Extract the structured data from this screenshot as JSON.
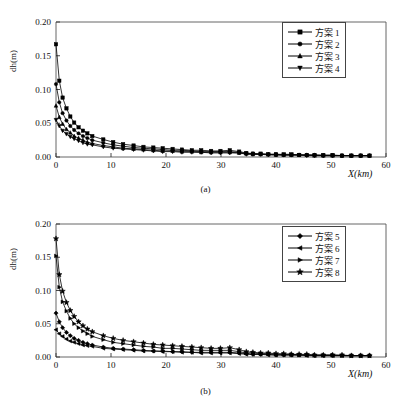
{
  "figure": {
    "panels": [
      {
        "id": "a",
        "caption": "(a)",
        "xlabel": "X(km)",
        "ylabel": "dh(m)",
        "legend": [
          {
            "label": "方案",
            "num": "1",
            "marker": "square"
          },
          {
            "label": "方案",
            "num": "2",
            "marker": "circle"
          },
          {
            "label": "方案",
            "num": "3",
            "marker": "triangle-up"
          },
          {
            "label": "方案",
            "num": "4",
            "marker": "triangle-down"
          }
        ]
      },
      {
        "id": "b",
        "caption": "(b)",
        "xlabel": "X(km)",
        "ylabel": "dh(m)",
        "legend": [
          {
            "label": "方案",
            "num": "5",
            "marker": "diamond"
          },
          {
            "label": "方案",
            "num": "6",
            "marker": "triangle-left"
          },
          {
            "label": "方案",
            "num": "7",
            "marker": "triangle-right"
          },
          {
            "label": "方案",
            "num": "8",
            "marker": "star"
          }
        ]
      }
    ]
  },
  "chart_data": [
    {
      "type": "line",
      "panel": "(a)",
      "title": "",
      "xlabel": "X(km)",
      "ylabel": "dh(m)",
      "xlim": [
        0,
        60
      ],
      "ylim": [
        0,
        0.2
      ],
      "xticks": [
        0,
        10,
        20,
        30,
        40,
        50,
        60
      ],
      "yticks": [
        0.0,
        0.05,
        0.1,
        0.15,
        0.2
      ],
      "ytick_labels": [
        "0.00",
        "0.05",
        "0.10",
        "0.15",
        "0.20"
      ],
      "xtick_labels": [
        "0",
        "10",
        "20",
        "30",
        "40",
        "50",
        "60"
      ],
      "grid": false,
      "legend_position": "upper-right",
      "color": "#000000",
      "x": [
        0,
        0.6,
        1.2,
        1.9,
        2.6,
        3.3,
        4.1,
        4.9,
        5.7,
        6.6,
        8.6,
        10.4,
        12.2,
        14.1,
        15.9,
        17.7,
        19.4,
        21.2,
        22.9,
        24.7,
        26.4,
        28.2,
        29.9,
        31.6,
        33.3,
        34.6,
        35.8,
        37.2,
        38.6,
        40.0,
        41.4,
        42.8,
        44.2,
        45.6,
        47.0,
        48.6,
        50.3,
        52.0,
        53.7,
        55.4,
        57.0
      ],
      "series": [
        {
          "name": "方案 1",
          "marker": "square",
          "values": [
            0.167,
            0.113,
            0.088,
            0.072,
            0.06,
            0.051,
            0.044,
            0.039,
            0.035,
            0.031,
            0.026,
            0.022,
            0.019,
            0.017,
            0.015,
            0.014,
            0.013,
            0.012,
            0.011,
            0.01,
            0.01,
            0.009,
            0.009,
            0.01,
            0.008,
            0.006,
            0.005,
            0.005,
            0.004,
            0.004,
            0.004,
            0.004,
            0.003,
            0.003,
            0.003,
            0.003,
            0.003,
            0.002,
            0.002,
            0.002,
            0.002
          ]
        },
        {
          "name": "方案 2",
          "marker": "circle",
          "values": [
            0.108,
            0.081,
            0.065,
            0.054,
            0.046,
            0.04,
            0.035,
            0.031,
            0.028,
            0.025,
            0.021,
            0.018,
            0.016,
            0.014,
            0.013,
            0.012,
            0.011,
            0.01,
            0.01,
            0.009,
            0.008,
            0.008,
            0.008,
            0.008,
            0.007,
            0.005,
            0.005,
            0.004,
            0.004,
            0.004,
            0.003,
            0.003,
            0.003,
            0.003,
            0.003,
            0.002,
            0.002,
            0.002,
            0.002,
            0.002,
            0.002
          ]
        },
        {
          "name": "方案 3",
          "marker": "triangle-up",
          "values": [
            0.076,
            0.059,
            0.049,
            0.041,
            0.036,
            0.031,
            0.028,
            0.025,
            0.022,
            0.02,
            0.017,
            0.015,
            0.013,
            0.012,
            0.011,
            0.01,
            0.009,
            0.009,
            0.008,
            0.008,
            0.007,
            0.007,
            0.007,
            0.007,
            0.006,
            0.005,
            0.004,
            0.004,
            0.004,
            0.003,
            0.003,
            0.003,
            0.003,
            0.003,
            0.002,
            0.002,
            0.002,
            0.002,
            0.002,
            0.002,
            0.002
          ]
        },
        {
          "name": "方案 4",
          "marker": "triangle-down",
          "values": [
            0.055,
            0.046,
            0.039,
            0.034,
            0.03,
            0.027,
            0.024,
            0.021,
            0.019,
            0.018,
            0.015,
            0.013,
            0.012,
            0.011,
            0.01,
            0.009,
            0.008,
            0.008,
            0.007,
            0.007,
            0.007,
            0.006,
            0.006,
            0.006,
            0.006,
            0.004,
            0.004,
            0.004,
            0.003,
            0.003,
            0.003,
            0.003,
            0.003,
            0.002,
            0.002,
            0.002,
            0.002,
            0.002,
            0.002,
            0.002,
            0.002
          ]
        }
      ]
    },
    {
      "type": "line",
      "panel": "(b)",
      "title": "",
      "xlabel": "X(km)",
      "ylabel": "dh(m)",
      "xlim": [
        0,
        60
      ],
      "ylim": [
        0,
        0.2
      ],
      "xticks": [
        0,
        10,
        20,
        30,
        40,
        50,
        60
      ],
      "yticks": [
        0.0,
        0.05,
        0.1,
        0.15,
        0.2
      ],
      "ytick_labels": [
        "0.00",
        "0.05",
        "0.10",
        "0.15",
        "0.20"
      ],
      "xtick_labels": [
        "0",
        "10",
        "20",
        "30",
        "40",
        "50",
        "60"
      ],
      "grid": false,
      "legend_position": "upper-right",
      "color": "#000000",
      "x": [
        0,
        0.6,
        1.2,
        1.9,
        2.6,
        3.3,
        4.1,
        4.9,
        5.7,
        6.6,
        8.6,
        10.4,
        12.2,
        14.1,
        15.9,
        17.7,
        19.4,
        21.2,
        22.9,
        24.7,
        26.4,
        28.2,
        29.9,
        31.6,
        33.3,
        34.6,
        35.8,
        37.2,
        38.6,
        40.0,
        41.4,
        42.8,
        44.2,
        45.6,
        47.0,
        48.6,
        50.3,
        52.0,
        53.7,
        55.4,
        57.0
      ],
      "series": [
        {
          "name": "方案 5",
          "marker": "diamond",
          "values": [
            0.066,
            0.053,
            0.044,
            0.037,
            0.032,
            0.028,
            0.025,
            0.022,
            0.02,
            0.018,
            0.015,
            0.013,
            0.012,
            0.011,
            0.01,
            0.009,
            0.009,
            0.008,
            0.008,
            0.007,
            0.007,
            0.007,
            0.007,
            0.007,
            0.006,
            0.005,
            0.004,
            0.004,
            0.004,
            0.003,
            0.003,
            0.003,
            0.003,
            0.003,
            0.002,
            0.002,
            0.002,
            0.002,
            0.002,
            0.002,
            0.002
          ]
        },
        {
          "name": "方案 6",
          "marker": "triangle-left",
          "values": [
            0.041,
            0.035,
            0.031,
            0.027,
            0.024,
            0.022,
            0.02,
            0.018,
            0.017,
            0.016,
            0.013,
            0.012,
            0.011,
            0.01,
            0.009,
            0.009,
            0.008,
            0.008,
            0.007,
            0.007,
            0.006,
            0.006,
            0.006,
            0.006,
            0.005,
            0.004,
            0.004,
            0.004,
            0.003,
            0.003,
            0.003,
            0.003,
            0.003,
            0.002,
            0.002,
            0.002,
            0.002,
            0.002,
            0.002,
            0.002,
            0.002
          ]
        },
        {
          "name": "方案 7",
          "marker": "triangle-right",
          "values": [
            0.152,
            0.105,
            0.083,
            0.069,
            0.058,
            0.05,
            0.044,
            0.039,
            0.035,
            0.031,
            0.026,
            0.022,
            0.02,
            0.018,
            0.016,
            0.015,
            0.013,
            0.013,
            0.012,
            0.011,
            0.01,
            0.01,
            0.01,
            0.01,
            0.008,
            0.006,
            0.006,
            0.005,
            0.005,
            0.004,
            0.004,
            0.004,
            0.003,
            0.003,
            0.003,
            0.003,
            0.003,
            0.002,
            0.002,
            0.002,
            0.002
          ]
        },
        {
          "name": "方案 8",
          "marker": "star",
          "values": [
            0.178,
            0.124,
            0.099,
            0.082,
            0.07,
            0.061,
            0.053,
            0.047,
            0.042,
            0.038,
            0.032,
            0.028,
            0.025,
            0.023,
            0.021,
            0.019,
            0.018,
            0.017,
            0.016,
            0.015,
            0.014,
            0.013,
            0.013,
            0.014,
            0.011,
            0.008,
            0.007,
            0.006,
            0.006,
            0.005,
            0.005,
            0.004,
            0.004,
            0.004,
            0.003,
            0.003,
            0.003,
            0.003,
            0.002,
            0.002,
            0.002
          ]
        }
      ]
    }
  ]
}
